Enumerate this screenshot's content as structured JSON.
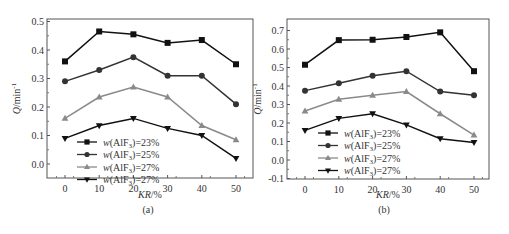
{
  "chart_data": [
    {
      "type": "line",
      "panel_label": "(a)",
      "title": "",
      "xlabel": "KR/%",
      "ylabel": "Q/min⁻¹",
      "x": [
        0,
        10,
        20,
        30,
        40,
        50
      ],
      "xlim": [
        -5,
        55
      ],
      "ylim": [
        -0.05,
        0.5
      ],
      "xticks": [
        "0",
        "10",
        "20",
        "30",
        "40",
        "50"
      ],
      "yticks": [
        "0.0",
        "0.1",
        "0.2",
        "0.3",
        "0.4",
        "0.5"
      ],
      "grid": false,
      "legend_position": "lower center",
      "series": [
        {
          "name": "w(AlF3)=23%",
          "marker": "square",
          "color": "#111111",
          "values": [
            0.36,
            0.465,
            0.455,
            0.425,
            0.435,
            0.35
          ]
        },
        {
          "name": "w(AlF3)=25%",
          "marker": "circle",
          "color": "#333333",
          "values": [
            0.29,
            0.33,
            0.375,
            0.31,
            0.31,
            0.21
          ]
        },
        {
          "name": "w(AlF3)=27%",
          "marker": "triangle-up",
          "color": "#8a8a8a",
          "values": [
            0.16,
            0.235,
            0.27,
            0.235,
            0.135,
            0.085
          ]
        },
        {
          "name": "w(AlF3)=27%",
          "marker": "triangle-down",
          "color": "#111111",
          "values": [
            0.09,
            0.135,
            0.16,
            0.125,
            0.1,
            0.02
          ]
        }
      ]
    },
    {
      "type": "line",
      "panel_label": "(b)",
      "title": "",
      "xlabel": "KR/%",
      "ylabel": "Q/min⁻¹",
      "x": [
        0,
        10,
        20,
        30,
        40,
        50
      ],
      "xlim": [
        -5,
        55
      ],
      "ylim": [
        -0.1,
        0.75
      ],
      "xticks": [
        "0",
        "10",
        "20",
        "30",
        "40",
        "50"
      ],
      "yticks": [
        "-0.1",
        "0.0",
        "0.1",
        "0.2",
        "0.3",
        "0.4",
        "0.5",
        "0.6",
        "0.7"
      ],
      "grid": false,
      "legend_position": "lower center",
      "series": [
        {
          "name": "w(AlF3)=23%",
          "marker": "square",
          "color": "#111111",
          "values": [
            0.515,
            0.648,
            0.65,
            0.665,
            0.69,
            0.48
          ]
        },
        {
          "name": "w(AlF3)=25%",
          "marker": "circle",
          "color": "#333333",
          "values": [
            0.375,
            0.415,
            0.455,
            0.48,
            0.37,
            0.35
          ]
        },
        {
          "name": "w(AlF3)=27%",
          "marker": "triangle-up",
          "color": "#8a8a8a",
          "values": [
            0.265,
            0.328,
            0.35,
            0.37,
            0.25,
            0.135
          ]
        },
        {
          "name": "w(AlF3)=27%",
          "marker": "triangle-down",
          "color": "#111111",
          "values": [
            0.16,
            0.225,
            0.25,
            0.19,
            0.115,
            0.095
          ]
        }
      ]
    }
  ],
  "legend": {
    "prefix": "w",
    "compound": "(AlF",
    "subscript": "3",
    "labels": [
      "=23%",
      "=25%",
      "=27%",
      "=27%"
    ]
  },
  "axis_text": {
    "xlabel_italic": "KR",
    "xlabel_suffix": "/%",
    "ylabel_italic": "Q",
    "ylabel_suffix": "/min",
    "ylabel_sup": "-1"
  }
}
